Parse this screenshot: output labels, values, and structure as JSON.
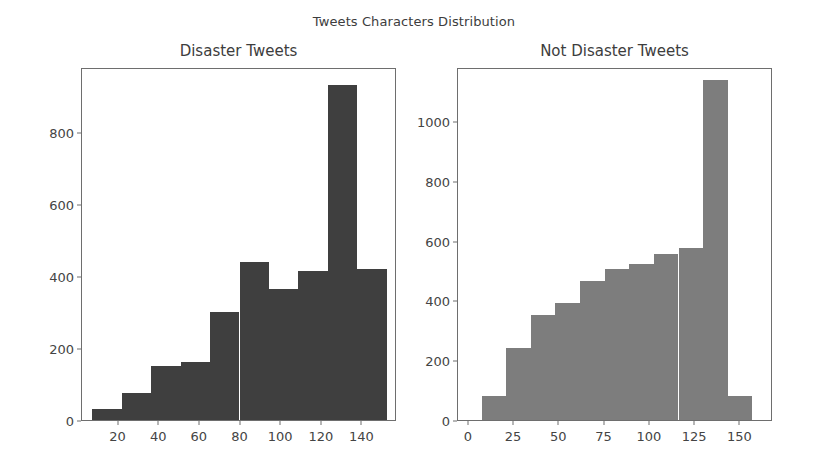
{
  "figure": {
    "suptitle": "Tweets Characters Distribution",
    "background": "#ffffff"
  },
  "chart_data": [
    {
      "type": "bar",
      "title": "Disaster Tweets",
      "subplot": "left",
      "xlabel": "",
      "ylabel": "",
      "color": "#3f3f3f",
      "grid": false,
      "legend": false,
      "xlim": [
        2,
        157
      ],
      "ylim": [
        0,
        980
      ],
      "xticks": [
        20,
        40,
        60,
        80,
        100,
        120,
        140
      ],
      "yticks": [
        0,
        200,
        400,
        600,
        800
      ],
      "bin_edges": [
        7,
        21.5,
        36,
        50.5,
        65,
        79.5,
        94,
        108.5,
        123,
        137.5,
        152
      ],
      "categories": [
        "7-21",
        "22-36",
        "37-50",
        "51-65",
        "66-79",
        "80-94",
        "95-108",
        "109-123",
        "124-137",
        "138-152"
      ],
      "values": [
        30,
        75,
        150,
        160,
        300,
        440,
        365,
        415,
        930,
        420
      ]
    },
    {
      "type": "bar",
      "title": "Not Disaster Tweets",
      "subplot": "right",
      "xlabel": "",
      "ylabel": "",
      "color": "#7d7d7d",
      "grid": false,
      "legend": false,
      "xlim": [
        -6,
        168
      ],
      "ylim": [
        0,
        1180
      ],
      "xticks": [
        0,
        25,
        50,
        75,
        100,
        125,
        150
      ],
      "yticks": [
        0,
        200,
        400,
        600,
        800,
        1000
      ],
      "bin_edges": [
        7,
        20.6,
        34.2,
        47.8,
        61.4,
        75,
        88.6,
        102.2,
        115.8,
        129.4,
        143,
        156.6
      ],
      "categories": [
        "7-20",
        "21-34",
        "35-47",
        "48-61",
        "62-75",
        "76-88",
        "89-102",
        "103-115",
        "116-129",
        "130-143",
        "144-156"
      ],
      "values": [
        80,
        240,
        350,
        390,
        465,
        505,
        520,
        555,
        575,
        1135,
        80
      ]
    }
  ]
}
